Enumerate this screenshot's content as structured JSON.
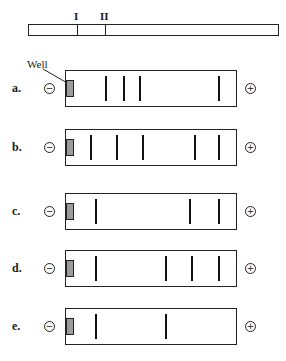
{
  "top_map": {
    "markers": [
      {
        "label": "I",
        "x_pct": 19.5
      },
      {
        "label": "II",
        "x_pct": 30.7
      }
    ]
  },
  "well_label": "Well",
  "electrodes": {
    "negative": "−",
    "positive": "+"
  },
  "gels": [
    {
      "label": "a.",
      "top": 70,
      "bands_x": [
        39,
        57,
        73,
        152
      ]
    },
    {
      "label": "b.",
      "top": 129,
      "bands_x": [
        24,
        50,
        76,
        128,
        152
      ]
    },
    {
      "label": "c.",
      "top": 193,
      "bands_x": [
        29,
        123,
        152
      ]
    },
    {
      "label": "d.",
      "top": 250,
      "bands_x": [
        29,
        99,
        125,
        152
      ]
    },
    {
      "label": "e.",
      "top": 308,
      "bands_x": [
        29,
        99
      ]
    }
  ],
  "colors": {
    "well": "#9c9c9c",
    "band": "#111111",
    "outline": "#222222"
  }
}
